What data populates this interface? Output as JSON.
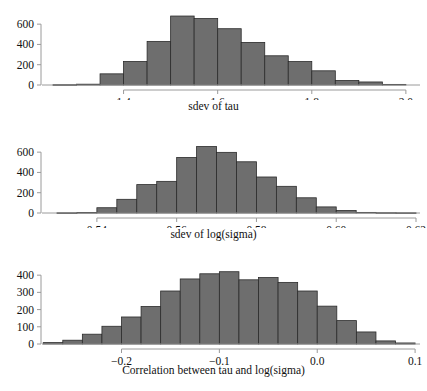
{
  "figure": {
    "background": "#ffffff",
    "bar_fill": "#6e6e6e",
    "bar_stroke": "#2b2b2b",
    "axis_color": "#9a9a9a",
    "text_color": "#111111"
  },
  "chart_data": [
    {
      "type": "bar",
      "title": "",
      "xlabel": "sdev of tau",
      "ylabel": "",
      "grid": false,
      "legend": null,
      "xlim": [
        1.25,
        2.03
      ],
      "ylim": [
        0,
        700
      ],
      "xticks": [
        1.4,
        1.6,
        1.8,
        2.0
      ],
      "xtick_labels": [
        "1.4",
        "1.6",
        "1.8",
        "2.0"
      ],
      "yticks": [
        0,
        200,
        400,
        600
      ],
      "ytick_labels": [
        "0",
        "200",
        "400",
        "600"
      ],
      "bin_width": 0.05,
      "bin_starts": [
        1.25,
        1.3,
        1.35,
        1.4,
        1.45,
        1.5,
        1.55,
        1.6,
        1.65,
        1.7,
        1.75,
        1.8,
        1.85,
        1.9,
        1.95
      ],
      "values": [
        3,
        8,
        110,
        232,
        430,
        680,
        655,
        555,
        420,
        288,
        231,
        140,
        45,
        30,
        6
      ]
    },
    {
      "type": "bar",
      "title": "",
      "xlabel": "sdev of log(sigma)",
      "ylabel": "",
      "grid": false,
      "legend": null,
      "xlim": [
        0.529,
        0.621
      ],
      "ylim": [
        0,
        700
      ],
      "xticks": [
        0.54,
        0.56,
        0.58,
        0.6,
        0.62
      ],
      "xtick_labels": [
        "0.54",
        "0.56",
        "0.58",
        "0.60",
        "0.62"
      ],
      "yticks": [
        0,
        200,
        400,
        600
      ],
      "ytick_labels": [
        "0",
        "200",
        "400",
        "600"
      ],
      "bin_width": 0.005,
      "bin_starts": [
        0.53,
        0.535,
        0.54,
        0.545,
        0.55,
        0.555,
        0.56,
        0.565,
        0.57,
        0.575,
        0.58,
        0.585,
        0.59,
        0.595,
        0.6,
        0.605,
        0.61,
        0.615
      ],
      "values": [
        2,
        5,
        52,
        135,
        280,
        312,
        548,
        655,
        598,
        505,
        355,
        263,
        150,
        60,
        25,
        6,
        3,
        2
      ]
    },
    {
      "type": "bar",
      "title": "",
      "xlabel": "Correlation between tau and log(sigma)",
      "ylabel": "",
      "grid": false,
      "legend": null,
      "xlim": [
        -0.27,
        0.105
      ],
      "ylim": [
        0,
        430
      ],
      "xticks": [
        -0.2,
        -0.1,
        0.0,
        0.1
      ],
      "xtick_labels": [
        "−0.2",
        "−0.1",
        "0.0",
        "0.1"
      ],
      "yticks": [
        0,
        100,
        200,
        300,
        400
      ],
      "ytick_labels": [
        "0",
        "100",
        "200",
        "300",
        "400"
      ],
      "bin_width": 0.02,
      "bin_starts": [
        -0.28,
        -0.26,
        -0.24,
        -0.22,
        -0.2,
        -0.18,
        -0.16,
        -0.14,
        -0.12,
        -0.1,
        -0.08,
        -0.06,
        -0.04,
        -0.02,
        0.0,
        0.02,
        0.04,
        0.06,
        0.08
      ],
      "values": [
        8,
        22,
        57,
        103,
        157,
        218,
        308,
        378,
        408,
        420,
        373,
        386,
        358,
        308,
        220,
        136,
        70,
        18,
        6
      ]
    }
  ],
  "panels": [
    {
      "name": "sdev-of-tau",
      "xlabel": "sdev of tau"
    },
    {
      "name": "sdev-of-log-sigma",
      "xlabel": "sdev of log(sigma)"
    },
    {
      "name": "correlation-tau-log-sigma",
      "xlabel": "Correlation between tau and log(sigma)"
    }
  ]
}
